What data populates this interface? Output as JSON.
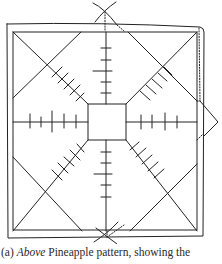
{
  "figure": {
    "stroke_color": "#222222",
    "background": "#ffffff"
  },
  "caption": {
    "label": "(a)",
    "emphasis": "Above",
    "text": "Pineapple pattern, showing the"
  }
}
